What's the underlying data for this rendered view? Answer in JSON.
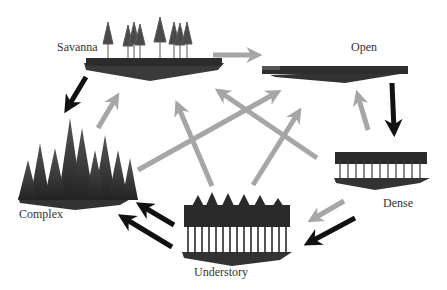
{
  "diagram": {
    "type": "state-transition",
    "nodes": [
      {
        "id": "savanna",
        "label": "Savanna"
      },
      {
        "id": "open",
        "label": "Open"
      },
      {
        "id": "dense",
        "label": "Dense"
      },
      {
        "id": "understory",
        "label": "Understory"
      },
      {
        "id": "complex",
        "label": "Complex"
      }
    ],
    "edges": [
      {
        "from": "savanna",
        "to": "open",
        "color": "gray"
      },
      {
        "from": "savanna",
        "to": "complex",
        "color": "black"
      },
      {
        "from": "complex",
        "to": "savanna",
        "color": "gray"
      },
      {
        "from": "complex",
        "to": "open",
        "color": "gray"
      },
      {
        "from": "understory",
        "to": "savanna",
        "color": "gray"
      },
      {
        "from": "understory",
        "to": "open",
        "color": "gray"
      },
      {
        "from": "dense",
        "to": "savanna",
        "color": "gray"
      },
      {
        "from": "dense",
        "to": "open",
        "color": "gray"
      },
      {
        "from": "open",
        "to": "dense",
        "color": "black"
      },
      {
        "from": "dense",
        "to": "understory",
        "color": "gray"
      },
      {
        "from": "dense",
        "to": "understory",
        "color": "black"
      },
      {
        "from": "understory",
        "to": "complex",
        "color": "black"
      },
      {
        "from": "understory",
        "to": "complex",
        "color": "black"
      }
    ],
    "colors": {
      "gray_arrow": "#a6a6a6",
      "black_arrow": "#111111",
      "stand": "#2a2a2a"
    }
  }
}
